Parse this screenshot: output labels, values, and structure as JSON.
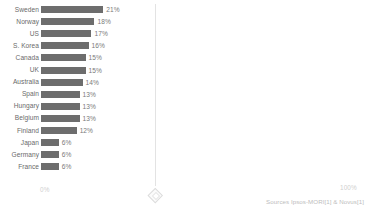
{
  "chart_data": {
    "type": "bar",
    "orientation": "horizontal",
    "title": "",
    "xlabel": "",
    "ylabel": "",
    "grid": false,
    "legend": null,
    "xlim": [
      0,
      100
    ],
    "axis_ticks": [
      "0%",
      "100%"
    ],
    "value_suffix": "%",
    "categories": [
      "Sweden",
      "Norway",
      "US",
      "S. Korea",
      "Canada",
      "UK",
      "Australia",
      "Spain",
      "Hungary",
      "Belgium",
      "Finland",
      "Japan",
      "Germany",
      "France"
    ],
    "values": [
      21,
      18,
      17,
      16,
      15,
      15,
      14,
      13,
      13,
      13,
      12,
      6,
      6,
      6
    ],
    "value_labels": [
      "21%",
      "18%",
      "17%",
      "16%",
      "15%",
      "15%",
      "14%",
      "13%",
      "13%",
      "13%",
      "12%",
      "6%",
      "6%",
      "6%"
    ],
    "bar_color": "#6d6d6d",
    "label_color": "#6a6a6a",
    "value_color": "#7a7a7a",
    "axis_label_color": "#cfcfcf"
  },
  "axis": {
    "min_label": "0%",
    "max_label": "100%"
  },
  "footer": {
    "source_note": "Sources Ipsos-MORI[1] & Novus[1]"
  },
  "divider": {
    "handle_icon": "diamond-resize-handle"
  }
}
